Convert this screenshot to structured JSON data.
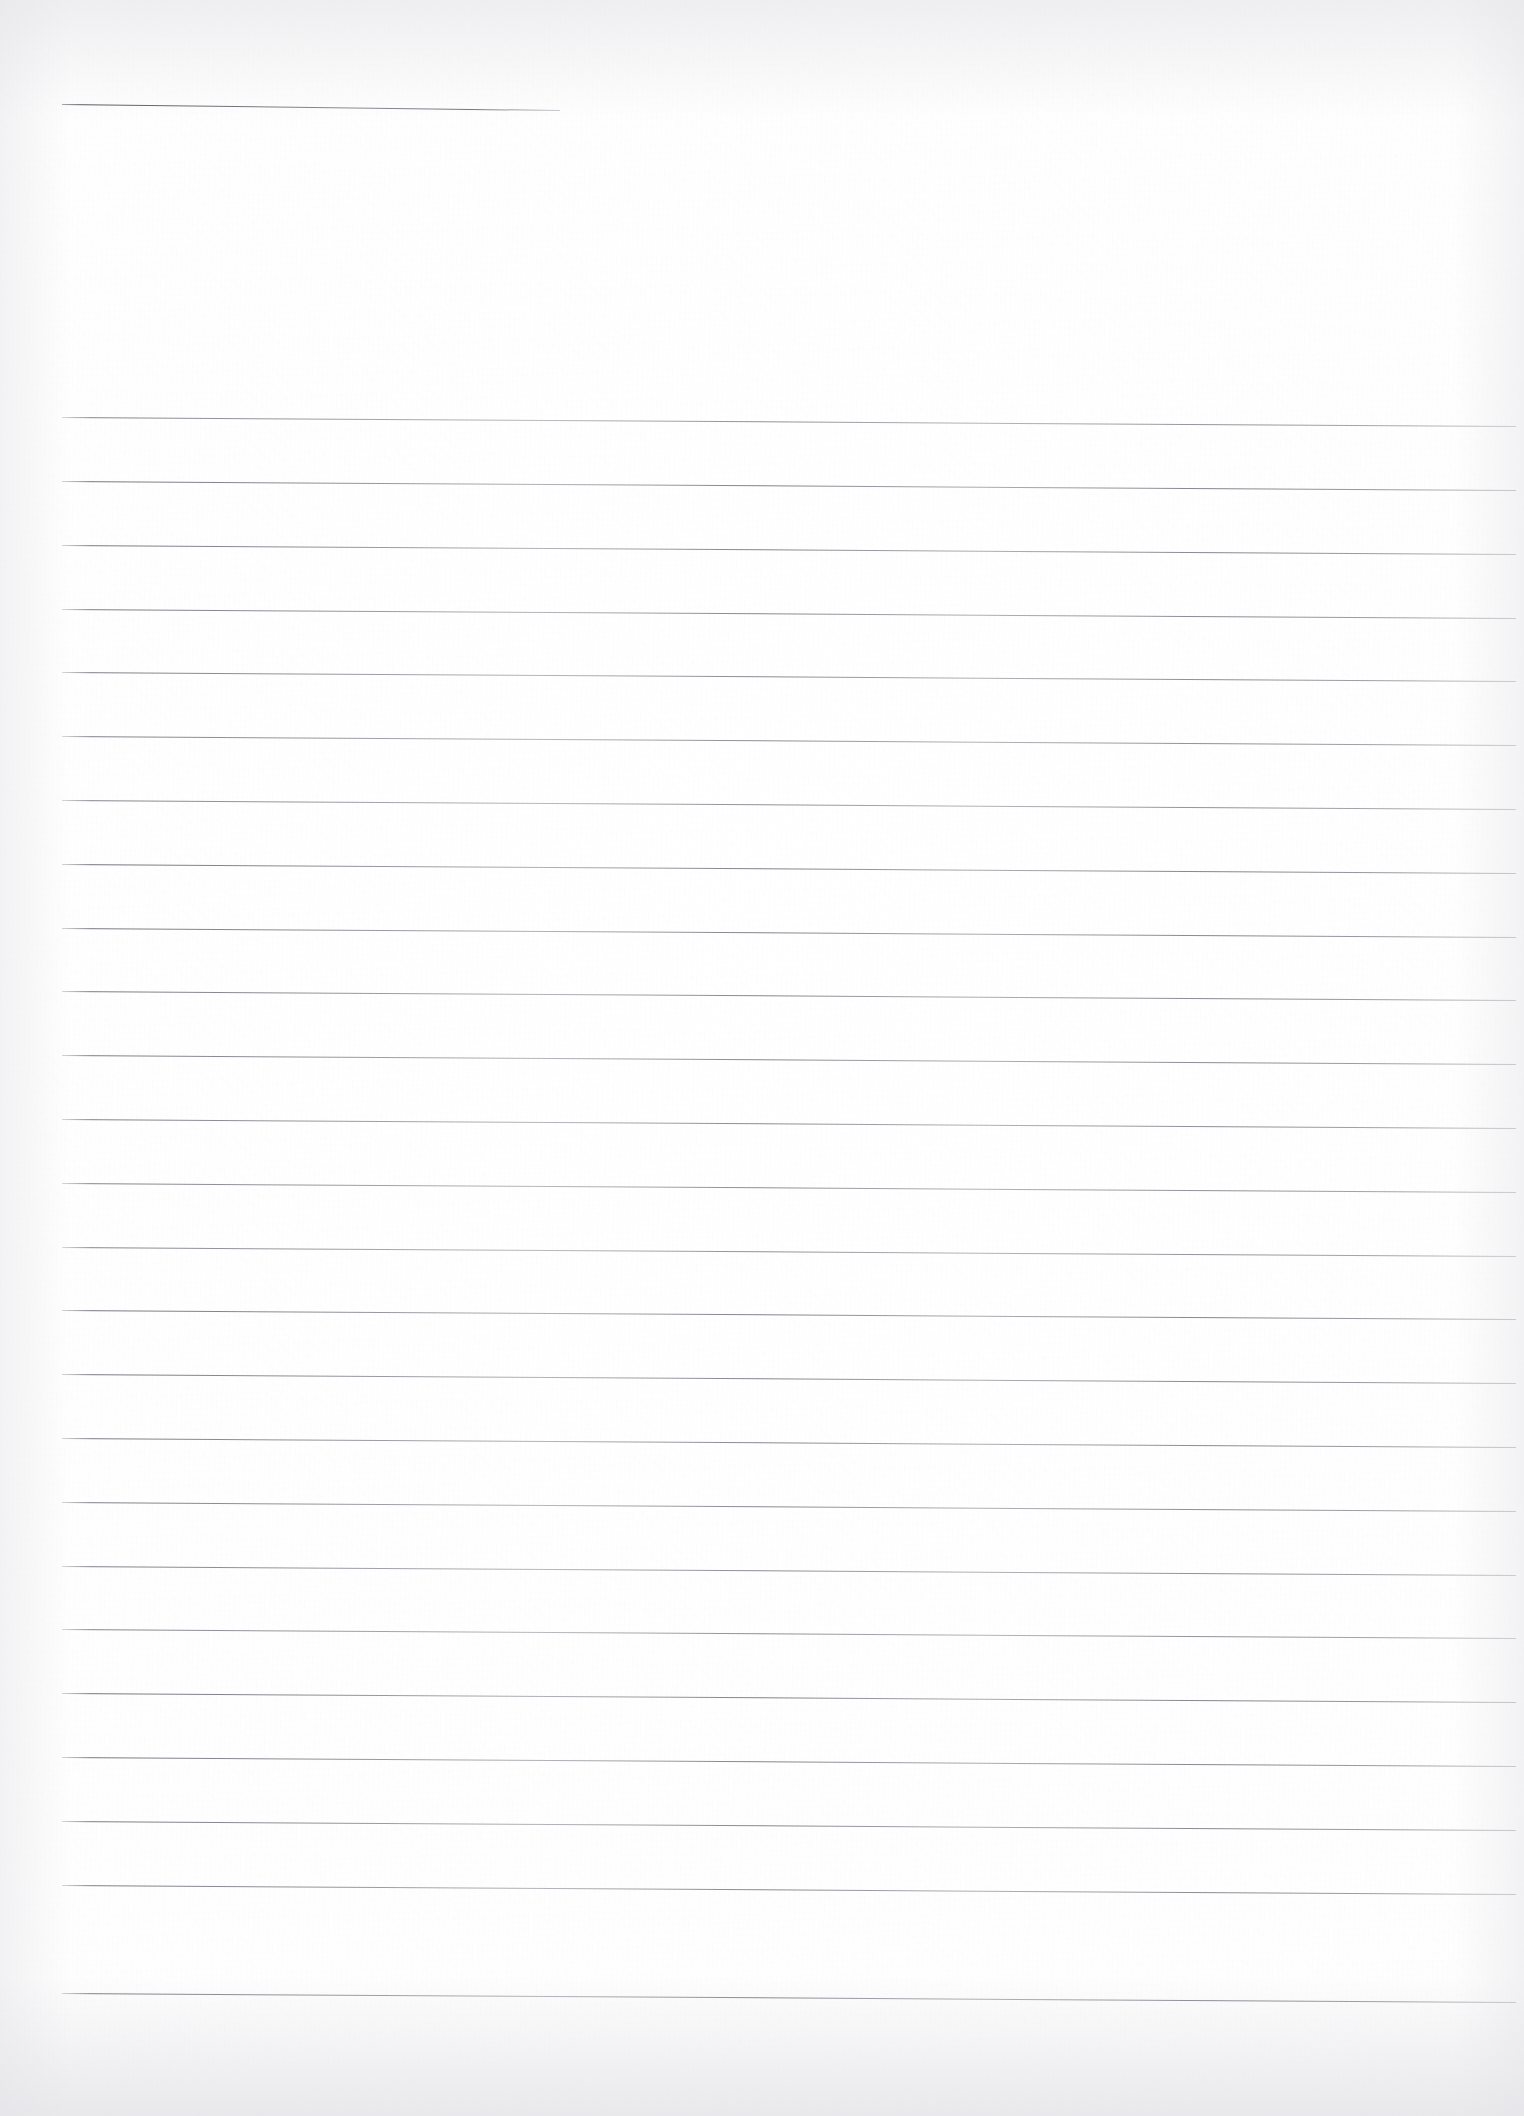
{
  "document": {
    "kind": "blank-ruled-notebook-page",
    "title": "Blank Ruled Notebook Page",
    "visible_text": "",
    "handwriting": "",
    "page_number": "",
    "background_color": "#fefefe",
    "rule_color": "#6c6c76",
    "page_width": 1524,
    "page_height": 2116
  },
  "header_rule": {
    "label": "title-rule",
    "x_start": 62,
    "x_end": 560,
    "y": 104,
    "slope_px": 6,
    "thickness": 1
  },
  "ruled_area": {
    "label": "ruled-writing-area",
    "x_start": 62,
    "x_end": 1516,
    "first_line_y": 417,
    "line_spacing": 63.8,
    "line_count": 25,
    "slope_px": 9,
    "thickness": 1,
    "line_y_positions": [
      417,
      481,
      545,
      609,
      672,
      736,
      800,
      864,
      928,
      991,
      1055,
      1119,
      1183,
      1247,
      1310,
      1374,
      1438,
      1502,
      1566,
      1629,
      1693,
      1757,
      1821,
      1885,
      1993
    ]
  },
  "margins": {
    "top_blank_height": 417,
    "left_margin": 62,
    "right_margin": 8,
    "bottom_blank_height": 123
  }
}
